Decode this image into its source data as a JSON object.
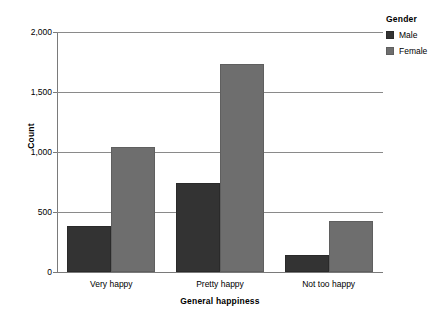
{
  "chart_data": {
    "type": "bar",
    "title": "",
    "subtitle": "",
    "xlabel": "General happiness",
    "ylabel": "Count",
    "categories": [
      "Very happy",
      "Pretty happy",
      "Not too happy"
    ],
    "series": [
      {
        "name": "Male",
        "color": "#333333",
        "values": [
          385,
          740,
          145
        ]
      },
      {
        "name": "Female",
        "color": "#6e6e6e",
        "values": [
          1040,
          1730,
          425
        ]
      }
    ],
    "legend": {
      "title": "Gender",
      "position": "right",
      "entries": [
        "Male",
        "Female"
      ]
    },
    "ylim": [
      0,
      2000
    ],
    "yticks": [
      0,
      500,
      1000,
      1500,
      2000
    ],
    "ytick_labels": [
      "0",
      "500",
      "1,000",
      "1,500",
      "2,000"
    ],
    "grid": true,
    "grid_axis": "y",
    "bar_mode": "grouped"
  }
}
